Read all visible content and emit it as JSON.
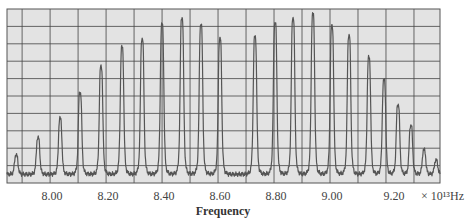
{
  "chart_data": {
    "type": "line",
    "title": "",
    "xlabel": "Frequency",
    "ylabel": "",
    "x_unit_label": "× 10¹³Hz",
    "x_ticks": [
      8.0,
      8.2,
      8.4,
      8.6,
      8.8,
      9.0,
      9.2
    ],
    "x_tick_labels": [
      "8.00",
      "8.20",
      "8.40",
      "8.60",
      "8.80",
      "9.00",
      "9.20"
    ],
    "xlim": [
      7.846,
      9.393
    ],
    "ylim": [
      0,
      100
    ],
    "grid": true,
    "grid_x_step": 0.1,
    "grid_y_divisions": 10,
    "legend": null,
    "background": "#e3e3e3",
    "line_color": "#555555",
    "grid_color": "#444444",
    "baseline": 5,
    "peak_width": 0.007,
    "series": [
      {
        "name": "P branch",
        "peaks": [
          {
            "freq": 7.879,
            "height": 16
          },
          {
            "freq": 7.957,
            "height": 26
          },
          {
            "freq": 8.036,
            "height": 37
          },
          {
            "freq": 8.107,
            "height": 52
          },
          {
            "freq": 8.182,
            "height": 67
          },
          {
            "freq": 8.257,
            "height": 78
          },
          {
            "freq": 8.329,
            "height": 83
          },
          {
            "freq": 8.4,
            "height": 91
          },
          {
            "freq": 8.471,
            "height": 95
          },
          {
            "freq": 8.539,
            "height": 91
          },
          {
            "freq": 8.607,
            "height": 83
          }
        ]
      },
      {
        "name": "R branch",
        "peaks": [
          {
            "freq": 8.732,
            "height": 84
          },
          {
            "freq": 8.804,
            "height": 92
          },
          {
            "freq": 8.868,
            "height": 95
          },
          {
            "freq": 8.939,
            "height": 97
          },
          {
            "freq": 9.007,
            "height": 90
          },
          {
            "freq": 9.068,
            "height": 85
          },
          {
            "freq": 9.139,
            "height": 72
          },
          {
            "freq": 9.193,
            "height": 59
          },
          {
            "freq": 9.243,
            "height": 45
          },
          {
            "freq": 9.289,
            "height": 33
          },
          {
            "freq": 9.336,
            "height": 19
          },
          {
            "freq": 9.379,
            "height": 13
          }
        ]
      }
    ]
  }
}
